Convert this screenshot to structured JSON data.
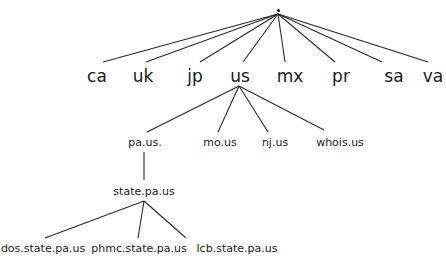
{
  "diagram": {
    "type": "tree",
    "title": "",
    "root": {
      "label": ".",
      "x": 278,
      "y": 13
    },
    "level1": [
      {
        "label": "ca",
        "x": 97,
        "y": 68
      },
      {
        "label": "uk",
        "x": 143,
        "y": 68
      },
      {
        "label": "jp",
        "x": 195,
        "y": 68
      },
      {
        "label": "us",
        "x": 240,
        "y": 68
      },
      {
        "label": "mx",
        "x": 290,
        "y": 68
      },
      {
        "label": "pr",
        "x": 341,
        "y": 68
      },
      {
        "label": "sa",
        "x": 394,
        "y": 68
      },
      {
        "label": "va",
        "x": 433,
        "y": 68
      }
    ],
    "level2": [
      {
        "label": "pa.us.",
        "x": 145,
        "y": 137
      },
      {
        "label": "mo.us",
        "x": 220,
        "y": 137
      },
      {
        "label": "nj.us",
        "x": 275,
        "y": 137
      },
      {
        "label": "whois.us",
        "x": 340,
        "y": 137
      }
    ],
    "level3": [
      {
        "label": "state.pa.us",
        "x": 144,
        "y": 186
      }
    ],
    "level4": [
      {
        "label": "dos.state.pa.us",
        "x": 43,
        "y": 243
      },
      {
        "label": "phmc.state.pa.us",
        "x": 139,
        "y": 243
      },
      {
        "label": "lcb.state.pa.us",
        "x": 237,
        "y": 243
      }
    ],
    "edges": [
      {
        "from": ".",
        "to": "ca",
        "x1": 278,
        "y1": 14,
        "x2": 103,
        "y2": 62
      },
      {
        "from": ".",
        "to": "uk",
        "x1": 278,
        "y1": 14,
        "x2": 146,
        "y2": 62
      },
      {
        "from": ".",
        "to": "jp",
        "x1": 278,
        "y1": 14,
        "x2": 200,
        "y2": 62
      },
      {
        "from": ".",
        "to": "us",
        "x1": 278,
        "y1": 14,
        "x2": 243,
        "y2": 62
      },
      {
        "from": ".",
        "to": "mx",
        "x1": 278,
        "y1": 14,
        "x2": 285,
        "y2": 62
      },
      {
        "from": ".",
        "to": "pr",
        "x1": 278,
        "y1": 14,
        "x2": 335,
        "y2": 62
      },
      {
        "from": ".",
        "to": "sa",
        "x1": 278,
        "y1": 14,
        "x2": 382,
        "y2": 62
      },
      {
        "from": ".",
        "to": "va",
        "x1": 278,
        "y1": 14,
        "x2": 428,
        "y2": 62
      },
      {
        "from": "us",
        "to": "pa.us.",
        "x1": 239,
        "y1": 86,
        "x2": 147,
        "y2": 132
      },
      {
        "from": "us",
        "to": "mo.us",
        "x1": 239,
        "y1": 86,
        "x2": 218,
        "y2": 132
      },
      {
        "from": "us",
        "to": "nj.us",
        "x1": 239,
        "y1": 86,
        "x2": 268,
        "y2": 132
      },
      {
        "from": "us",
        "to": "whois.us",
        "x1": 239,
        "y1": 86,
        "x2": 324,
        "y2": 130
      },
      {
        "from": "pa.us.",
        "to": "state.pa.us",
        "x1": 144,
        "y1": 152,
        "x2": 144,
        "y2": 180
      },
      {
        "from": "state.pa.us",
        "to": "dos.state.pa.us",
        "x1": 144,
        "y1": 201,
        "x2": 45,
        "y2": 238
      },
      {
        "from": "state.pa.us",
        "to": "phmc.state.pa.us",
        "x1": 144,
        "y1": 201,
        "x2": 138,
        "y2": 238
      },
      {
        "from": "state.pa.us",
        "to": "lcb.state.pa.us",
        "x1": 144,
        "y1": 201,
        "x2": 186,
        "y2": 238
      }
    ]
  }
}
